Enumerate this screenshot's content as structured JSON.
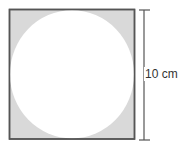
{
  "diagram": {
    "shape": "circle inscribed in square",
    "dimension_label": "10 cm",
    "colors": {
      "shaded_region": "#d9d9d9",
      "circle_fill": "#ffffff",
      "stroke": "#555555"
    }
  }
}
